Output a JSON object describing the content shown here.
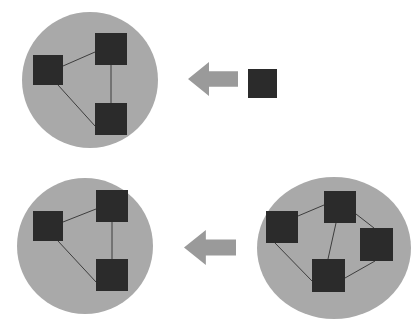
{
  "diagram": {
    "background_color": "#ffffff",
    "palette": {
      "cluster_fill": "#a9a9a9",
      "node_fill": "#2b2b2b",
      "edge_stroke": "#3d3d3d",
      "arrow_fill": "#9a9a9a"
    },
    "style": {
      "edge_width": 1,
      "node_size": 30
    },
    "clusters": [
      {
        "id": "cluster-top-left",
        "label": "top-left-cluster",
        "cx": 90,
        "cy": 80,
        "rx": 68,
        "ry": 68,
        "node_count": 3,
        "edge_count": 3,
        "nodes": [
          {
            "id": "tl-n1",
            "label": "node-left",
            "x": 33,
            "y": 55,
            "w": 30,
            "h": 30
          },
          {
            "id": "tl-n2",
            "label": "node-top",
            "x": 95,
            "y": 33,
            "w": 32,
            "h": 32
          },
          {
            "id": "tl-n3",
            "label": "node-bottom",
            "x": 95,
            "y": 103,
            "w": 32,
            "h": 32
          }
        ],
        "edges": [
          {
            "id": "tl-e1",
            "label": "edge-left-top",
            "x1": 63,
            "y1": 66,
            "x2": 95,
            "y2": 52
          },
          {
            "id": "tl-e2",
            "label": "edge-top-bottom",
            "x1": 111,
            "y1": 65,
            "x2": 111,
            "y2": 103
          },
          {
            "id": "tl-e3",
            "label": "edge-left-bottom",
            "x1": 58,
            "y1": 85,
            "x2": 95,
            "y2": 126
          }
        ]
      },
      {
        "id": "cluster-bottom-left",
        "label": "bottom-left-cluster",
        "cx": 85,
        "cy": 246,
        "rx": 68,
        "ry": 68,
        "node_count": 3,
        "edge_count": 3,
        "nodes": [
          {
            "id": "bl-n1",
            "label": "node-left",
            "x": 33,
            "y": 211,
            "w": 30,
            "h": 30
          },
          {
            "id": "bl-n2",
            "label": "node-top",
            "x": 96,
            "y": 190,
            "w": 32,
            "h": 32
          },
          {
            "id": "bl-n3",
            "label": "node-bottom",
            "x": 96,
            "y": 259,
            "w": 32,
            "h": 32
          }
        ],
        "edges": [
          {
            "id": "bl-e1",
            "label": "edge-left-top",
            "x1": 63,
            "y1": 222,
            "x2": 96,
            "y2": 209
          },
          {
            "id": "bl-e2",
            "label": "edge-top-bottom",
            "x1": 112,
            "y1": 222,
            "x2": 112,
            "y2": 259
          },
          {
            "id": "bl-e3",
            "label": "edge-left-bottom",
            "x1": 58,
            "y1": 241,
            "x2": 96,
            "y2": 282
          }
        ]
      },
      {
        "id": "cluster-bottom-right",
        "label": "bottom-right-cluster",
        "cx": 334,
        "cy": 248,
        "rx": 77,
        "ry": 71,
        "node_count": 5,
        "edge_count": 5,
        "nodes": [
          {
            "id": "br-n1",
            "label": "node-left",
            "x": 266,
            "y": 211,
            "w": 32,
            "h": 32
          },
          {
            "id": "br-n2",
            "label": "node-top",
            "x": 324,
            "y": 191,
            "w": 32,
            "h": 32
          },
          {
            "id": "br-n3",
            "label": "node-right",
            "x": 360,
            "y": 228,
            "w": 33,
            "h": 33
          },
          {
            "id": "br-n4",
            "label": "node-bottom-center",
            "x": 312,
            "y": 259,
            "w": 33,
            "h": 33
          },
          {
            "id": "br-n5",
            "label": "node-center",
            "x": 324,
            "y": 191,
            "w": 0,
            "h": 0
          }
        ],
        "edges": [
          {
            "id": "br-e1",
            "label": "edge-left-top",
            "x1": 298,
            "y1": 216,
            "x2": 324,
            "y2": 205
          },
          {
            "id": "br-e2",
            "label": "edge-top-right",
            "x1": 356,
            "y1": 214,
            "x2": 374,
            "y2": 228
          },
          {
            "id": "br-e3",
            "label": "edge-top-bottomcenter",
            "x1": 336,
            "y1": 223,
            "x2": 328,
            "y2": 259
          },
          {
            "id": "br-e4",
            "label": "edge-left-bottomcenter",
            "x1": 275,
            "y1": 243,
            "x2": 312,
            "y2": 281
          },
          {
            "id": "br-e5",
            "label": "edge-bottomcenter-right",
            "x1": 345,
            "y1": 278,
            "x2": 375,
            "y2": 261
          }
        ]
      }
    ],
    "isolated_nodes": [
      {
        "id": "iso-n1",
        "label": "isolated-node",
        "x": 248,
        "y": 69,
        "w": 29,
        "h": 29
      }
    ],
    "arrows": [
      {
        "id": "arrow-top",
        "label": "merge-arrow-top",
        "direction": "left",
        "x": 188,
        "y": 62,
        "w": 50,
        "h": 34
      },
      {
        "id": "arrow-bottom",
        "label": "merge-arrow-bottom",
        "direction": "left",
        "x": 184,
        "y": 230,
        "w": 52,
        "h": 35
      }
    ]
  }
}
